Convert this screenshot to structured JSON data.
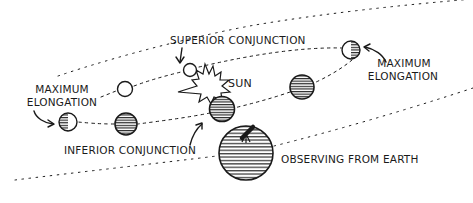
{
  "diagram": {
    "type": "orbital-phases-of-inferior-planet",
    "colors": {
      "ink": "#1a1a1a",
      "background": "#ffffff"
    },
    "labels": {
      "superior_conjunction": "SUPERIOR CONJUNCTION",
      "sun": "SUN",
      "max_elongation_left_line1": "MAXIMUM",
      "max_elongation_left_line2": "ELONGATION",
      "max_elongation_right_line1": "MAXIMUM",
      "max_elongation_right_line2": "ELONGATION",
      "inferior_conjunction": "INFERIOR CONJUNCTION",
      "earth": "OBSERVING FROM EARTH"
    },
    "nodes": [
      {
        "id": "sun",
        "kind": "starburst",
        "label": "SUN"
      },
      {
        "id": "planet-superior-conjunction",
        "kind": "planet",
        "phase": "full",
        "label": "SUPERIOR CONJUNCTION"
      },
      {
        "id": "planet-upper-left",
        "kind": "planet",
        "phase": "full"
      },
      {
        "id": "planet-max-elongation-right",
        "kind": "planet",
        "phase": "half",
        "label": "MAXIMUM ELONGATION"
      },
      {
        "id": "planet-lower-right",
        "kind": "planet",
        "phase": "crescent"
      },
      {
        "id": "planet-inferior-conjunction",
        "kind": "planet",
        "phase": "new",
        "label": "INFERIOR CONJUNCTION"
      },
      {
        "id": "planet-lower-left",
        "kind": "planet",
        "phase": "crescent"
      },
      {
        "id": "planet-max-elongation-left",
        "kind": "planet",
        "phase": "half",
        "label": "MAXIMUM ELONGATION"
      },
      {
        "id": "earth",
        "kind": "observer-planet",
        "label": "OBSERVING FROM EARTH",
        "has_telescope": true
      }
    ],
    "orbits": [
      {
        "id": "inner-orbit",
        "style": "dotted",
        "body": "inferior planet"
      },
      {
        "id": "outer-orbit",
        "style": "dotted",
        "body": "earth"
      }
    ]
  }
}
